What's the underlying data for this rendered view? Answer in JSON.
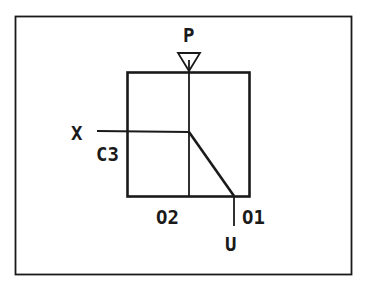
{
  "diagram": {
    "type": "valve-schematic",
    "colors": {
      "stroke": "#1a1a1a",
      "background": "#ffffff"
    },
    "labels": {
      "P": "P",
      "X": "X",
      "C3": "C3",
      "O2": "O2",
      "O1": "O1",
      "U": "U"
    }
  }
}
